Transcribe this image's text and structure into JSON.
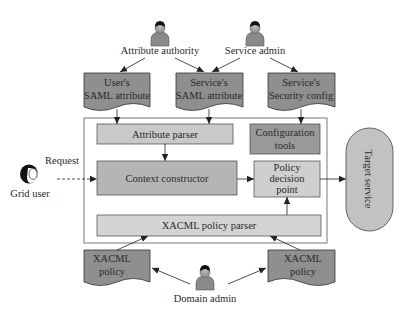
{
  "actors": {
    "attribute_authority": "Attribute authority",
    "service_admin": "Service admin",
    "domain_admin": "Domain admin",
    "grid_user": "Grid user"
  },
  "documents": {
    "users_saml": [
      "User's",
      "SAML attribute"
    ],
    "services_saml": [
      "Service's",
      "SAML attribute"
    ],
    "services_security": [
      "Service's",
      "Security config"
    ],
    "xacml_left": [
      "XACML",
      "policy"
    ],
    "xacml_right": [
      "XACML",
      "policy"
    ]
  },
  "components": {
    "attribute_parser": "Attribute parser",
    "configuration_tools": [
      "Configuration",
      "tools"
    ],
    "context_constructor": "Context constructor",
    "policy_decision_point": [
      "Policy",
      "decision",
      "point"
    ],
    "xacml_policy_parser": "XACML policy parser",
    "target_service": "Target service"
  },
  "edges": {
    "request_label": "Request"
  },
  "colors": {
    "document_fill": "#8f8f8f",
    "light_box_fill": "#d6d6d6",
    "mid_box_fill": "#b3b3b3",
    "dark_box_fill": "#9a9a9a",
    "stroke": "#333333"
  }
}
